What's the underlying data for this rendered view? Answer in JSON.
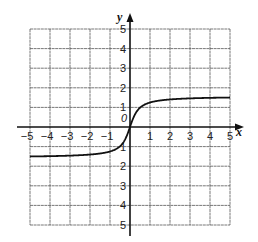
{
  "chart_data": {
    "type": "line",
    "title": "",
    "xlabel": "x",
    "ylabel": "y",
    "xlim": [
      -5,
      5
    ],
    "ylim": [
      -5,
      5
    ],
    "grid": true,
    "x_ticks": [
      -5,
      -4,
      -3,
      -2,
      -1,
      1,
      2,
      3,
      4,
      5
    ],
    "y_ticks": [
      5,
      4,
      3,
      2,
      1,
      -1,
      -2,
      -3,
      -4,
      -5
    ],
    "y_tick_labels": [
      "5",
      "4",
      "3",
      "2",
      "1",
      "1",
      "2",
      "3",
      "4",
      "5"
    ],
    "origin_label": "0",
    "series": [
      {
        "name": "curve",
        "description": "increasing S-shaped curve through origin with horizontal asymptotes near y=±1.5",
        "x": [
          -5,
          -4,
          -3,
          -2,
          -1,
          -0.5,
          -0.25,
          0,
          0.25,
          0.5,
          1,
          2,
          3,
          4,
          5
        ],
        "y": [
          -1.5,
          -1.49,
          -1.46,
          -1.41,
          -1.25,
          -0.98,
          -0.64,
          0,
          0.64,
          0.98,
          1.25,
          1.41,
          1.46,
          1.49,
          1.5
        ]
      }
    ]
  }
}
